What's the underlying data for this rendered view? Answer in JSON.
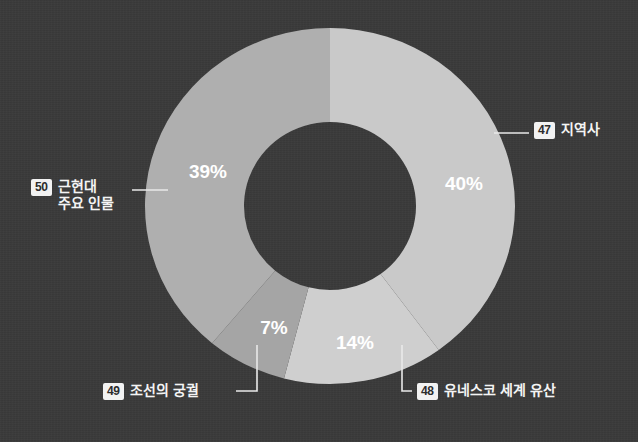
{
  "chart_data": {
    "type": "pie",
    "variant": "donut",
    "title": "",
    "subtitle": "",
    "xlabel": "",
    "ylabel": "",
    "legend_position": "callouts-around-chart",
    "grid": false,
    "value_unit": "%",
    "start_angle_deg": 0,
    "direction": "clockwise",
    "categories": [
      "지역사",
      "유네스코 세계 유산",
      "조선의 궁궐",
      "근현대 주요 인물"
    ],
    "values": [
      40,
      14,
      7,
      39
    ],
    "labels": [
      "40%",
      "14%",
      "7%",
      "39%"
    ],
    "slices": [
      {
        "index": 0,
        "badge": "47",
        "name": "지역사",
        "name_line2": "",
        "value": 40,
        "label": "40%",
        "color": "#c9c9c9",
        "start_deg": 0,
        "end_deg": 144
      },
      {
        "index": 1,
        "badge": "48",
        "name": "유네스코 세계 유산",
        "name_line2": "",
        "value": 14,
        "label": "14%",
        "color": "#cfcfcf",
        "start_deg": 144,
        "end_deg": 194.4
      },
      {
        "index": 2,
        "badge": "49",
        "name": "조선의 궁궐",
        "name_line2": "",
        "value": 7,
        "label": "7%",
        "color": "#a5a5a5",
        "start_deg": 194.4,
        "end_deg": 219.6
      },
      {
        "index": 3,
        "badge": "50",
        "name": "근현대",
        "name_line2": "주요 인물",
        "value": 39,
        "label": "39%",
        "color": "#afafaf",
        "start_deg": 219.6,
        "end_deg": 360
      }
    ]
  },
  "colors": {
    "background": "#3a3a3a",
    "text": "#f4f4f4",
    "badge_background": "#f2f2f2",
    "badge_text": "#2c2c2c",
    "leader_line": "#e9e9e9",
    "slice_region": "#c9c9c9",
    "slice_heritage": "#cfcfcf",
    "slice_palace": "#a5a5a5",
    "slice_people": "#afafaf"
  },
  "callouts": {
    "region": {
      "badge": "47",
      "text": "지역사"
    },
    "heritage": {
      "badge": "48",
      "text": "유네스코 세계 유산"
    },
    "palace": {
      "badge": "49",
      "text": "조선의 궁궐"
    },
    "people": {
      "badge": "50",
      "text": "근현대",
      "text_line2": "주요 인물"
    }
  },
  "percent_labels": {
    "region": "40%",
    "heritage": "14%",
    "palace": "7%",
    "people": "39%"
  }
}
